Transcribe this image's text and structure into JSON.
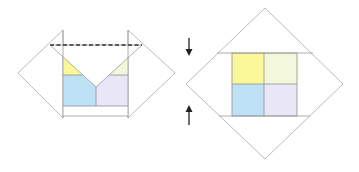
{
  "diagram": {
    "colors": {
      "yellow": "#fbf89a",
      "pale_green": "#f3f8dc",
      "blue": "#bfe1f5",
      "lavender": "#e8e6f7",
      "outline": "#a9a9a9",
      "dashed_fold": "#333333",
      "arrow": "#222222"
    },
    "left_figure": {
      "elements": [
        "left-flap",
        "right-flap",
        "center-panel",
        "valley-fold-dashed-line",
        "v-fold-triangle",
        "four-color-square"
      ]
    },
    "right_figure": {
      "elements": [
        "diamond",
        "upper-fold-line",
        "lower-fold-line",
        "four-color-square",
        "down-arrow",
        "up-arrow"
      ],
      "arrows": [
        {
          "name": "down-arrow",
          "direction": "down"
        },
        {
          "name": "up-arrow",
          "direction": "up"
        }
      ]
    }
  }
}
